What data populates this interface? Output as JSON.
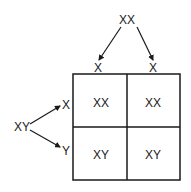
{
  "diagram": {
    "type": "punnett-square",
    "parent_top": {
      "genotype": "XX",
      "gametes": [
        "X",
        "X"
      ]
    },
    "parent_left": {
      "genotype": "XY",
      "gametes": [
        "X",
        "Y"
      ]
    },
    "cells": [
      [
        "XX",
        "XX"
      ],
      [
        "XY",
        "XY"
      ]
    ],
    "colors": {
      "line": "#1a1a1a",
      "background": "#ffffff"
    }
  }
}
